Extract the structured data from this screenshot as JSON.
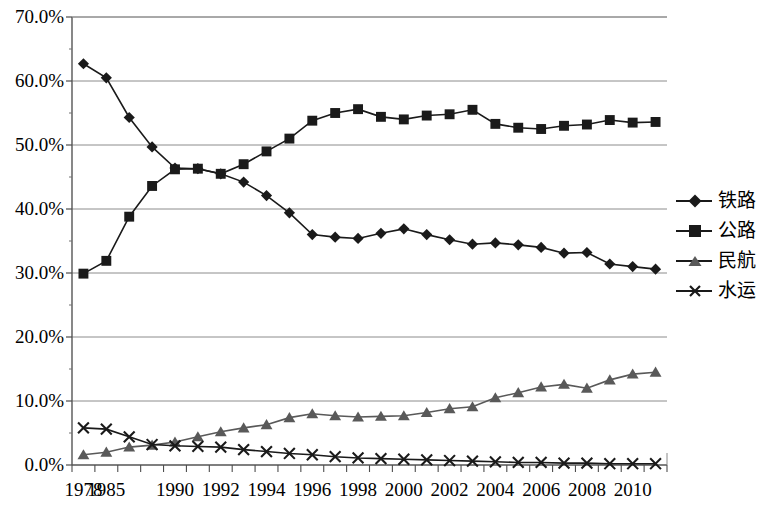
{
  "chart_data": {
    "type": "line",
    "title": "",
    "subtitle": "",
    "xlabel": "",
    "ylabel": "",
    "grid": true,
    "legend_position": "right",
    "ylim": [
      0,
      70
    ],
    "ytick_labels": [
      "70.0%",
      "60.0%",
      "50.0%",
      "40.0%",
      "30.0%",
      "20.0%",
      "10.0%",
      "0.0%"
    ],
    "ytick_values": [
      70,
      60,
      50,
      40,
      30,
      20,
      10,
      0
    ],
    "x": [
      1978,
      1985,
      1988,
      1989,
      1990,
      1991,
      1992,
      1993,
      1994,
      1995,
      1996,
      1997,
      1998,
      1999,
      2000,
      2001,
      2002,
      2003,
      2004,
      2005,
      2006,
      2007,
      2008,
      2009,
      2010,
      2011
    ],
    "xtick_labels": [
      "1978",
      "1985",
      "",
      "",
      "1990",
      "",
      "1992",
      "",
      "1994",
      "",
      "1996",
      "",
      "1998",
      "",
      "2000",
      "",
      "2002",
      "",
      "2004",
      "",
      "2006",
      "",
      "2008",
      "",
      "2010",
      ""
    ],
    "series": [
      {
        "name": "铁路",
        "marker": "diamond",
        "color": "#1a1a1a",
        "values": [
          62.7,
          60.5,
          54.3,
          49.7,
          46.4,
          46.3,
          45.5,
          44.2,
          42.1,
          39.4,
          36.0,
          35.6,
          35.4,
          36.2,
          36.9,
          36.0,
          35.2,
          34.5,
          34.7,
          34.4,
          34.0,
          33.1,
          33.2,
          31.4,
          31.0,
          30.6
        ]
      },
      {
        "name": "公路",
        "marker": "square",
        "color": "#1a1a1a",
        "values": [
          29.9,
          31.9,
          38.8,
          43.6,
          46.2,
          46.3,
          45.5,
          47.0,
          49.0,
          51.0,
          53.8,
          55.0,
          55.6,
          54.4,
          54.0,
          54.6,
          54.8,
          55.5,
          53.3,
          52.7,
          52.5,
          53.0,
          53.2,
          53.9,
          53.5,
          53.6
        ]
      },
      {
        "name": "民航",
        "marker": "triangle",
        "color": "#595959",
        "values": [
          1.6,
          2.0,
          2.8,
          3.1,
          3.6,
          4.4,
          5.2,
          5.8,
          6.3,
          7.4,
          8.0,
          7.7,
          7.5,
          7.6,
          7.7,
          8.2,
          8.8,
          9.1,
          10.5,
          11.3,
          12.2,
          12.6,
          12.0,
          13.3,
          14.2,
          14.5
        ]
      },
      {
        "name": "水运",
        "marker": "x",
        "color": "#1a1a1a",
        "values": [
          5.8,
          5.6,
          4.4,
          3.2,
          3.0,
          2.9,
          2.8,
          2.4,
          2.1,
          1.8,
          1.6,
          1.3,
          1.1,
          1.0,
          0.9,
          0.8,
          0.7,
          0.6,
          0.5,
          0.4,
          0.4,
          0.3,
          0.3,
          0.2,
          0.2,
          0.2
        ]
      }
    ]
  },
  "legend": {
    "items": [
      {
        "label": "铁路",
        "marker": "diamond"
      },
      {
        "label": "公路",
        "marker": "square"
      },
      {
        "label": "民航",
        "marker": "triangle"
      },
      {
        "label": "水运",
        "marker": "x"
      }
    ]
  }
}
